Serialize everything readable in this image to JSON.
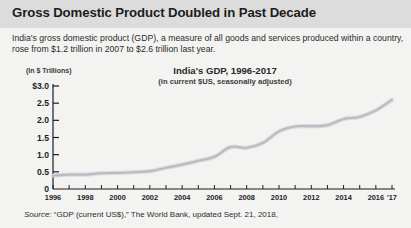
{
  "header": {
    "headline": "Gross Domestic Product Doubled in Past Decade",
    "band_color": "#dcdcdc"
  },
  "deck": {
    "text": "India's gross domestic product (GDP), a measure of all goods and services produced within a country, rose from $1.2 trillion in 2007 to $2.6 trillion last year."
  },
  "source": {
    "label": "Source:",
    "text": " “GDP (current US$),” The World Bank, updated Sept. 21, 2018,"
  },
  "chart_data": {
    "type": "line",
    "title": "India's GDP, 1996-2017",
    "subtitle": "(in current $US, seasonally adjusted)",
    "units_label": "(In $ Trillions)",
    "xlabel": "",
    "ylabel": "",
    "ylim": [
      0,
      3.0
    ],
    "xlim": [
      1996,
      2017
    ],
    "grid": false,
    "legend": "none",
    "line_color": "#b9bcc0",
    "y_ticks": [
      0,
      0.5,
      1.0,
      1.5,
      2.0,
      2.5,
      3.0
    ],
    "y_tick_labels": [
      "0",
      "0.5",
      "1.0",
      "1.5",
      "2.0",
      "2.5",
      "$3.0"
    ],
    "x_ticks": [
      1996,
      1997,
      1998,
      1999,
      2000,
      2001,
      2002,
      2003,
      2004,
      2005,
      2006,
      2007,
      2008,
      2009,
      2010,
      2011,
      2012,
      2013,
      2014,
      2015,
      2016,
      2017
    ],
    "x_tick_labels": [
      "1996",
      "1998",
      "2000",
      "2002",
      "2004",
      "2006",
      "2008",
      "2010",
      "2012",
      "2014",
      "2016",
      "'17"
    ],
    "x_labeled_years": [
      1996,
      1998,
      2000,
      2002,
      2004,
      2006,
      2008,
      2010,
      2012,
      2014,
      2016,
      2017
    ],
    "x": [
      1996,
      1997,
      1998,
      1999,
      2000,
      2001,
      2002,
      2003,
      2004,
      2005,
      2006,
      2007,
      2008,
      2009,
      2010,
      2011,
      2012,
      2013,
      2014,
      2015,
      2016,
      2017
    ],
    "values": [
      0.39,
      0.42,
      0.42,
      0.46,
      0.47,
      0.49,
      0.52,
      0.62,
      0.71,
      0.82,
      0.94,
      1.22,
      1.2,
      1.34,
      1.68,
      1.82,
      1.83,
      1.86,
      2.04,
      2.1,
      2.29,
      2.6
    ],
    "series": [
      {
        "name": "India GDP (current US$, trillions)",
        "values": [
          0.39,
          0.42,
          0.42,
          0.46,
          0.47,
          0.49,
          0.52,
          0.62,
          0.71,
          0.82,
          0.94,
          1.22,
          1.2,
          1.34,
          1.68,
          1.82,
          1.83,
          1.86,
          2.04,
          2.1,
          2.29,
          2.6
        ]
      }
    ]
  }
}
